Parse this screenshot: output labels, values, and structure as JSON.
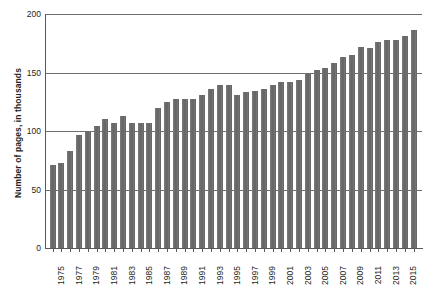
{
  "chart_data": {
    "type": "bar",
    "title": "",
    "xlabel": "",
    "ylabel": "Number of pages, in thousands",
    "ylim": [
      0,
      200
    ],
    "yticks": [
      0,
      50,
      100,
      150,
      200
    ],
    "grid": "horizontal",
    "legend": "none",
    "bar_color": "#6e6e6e",
    "axis_color": "#58595b",
    "categories": [
      "1975",
      "1976",
      "1977",
      "1978",
      "1979",
      "1980",
      "1981",
      "1982",
      "1983",
      "1984",
      "1985",
      "1986",
      "1987",
      "1988",
      "1989",
      "1990",
      "1991",
      "1992",
      "1993",
      "1994",
      "1995",
      "1996",
      "1997",
      "1998",
      "1999",
      "2000",
      "2001",
      "2002",
      "2003",
      "2004",
      "2005",
      "2006",
      "2007",
      "2008",
      "2009",
      "2010",
      "2011",
      "2012",
      "2013",
      "2014",
      "2015",
      "2016"
    ],
    "xtick_labels": [
      "1975",
      "1977",
      "1979",
      "1981",
      "1983",
      "1985",
      "1987",
      "1989",
      "1991",
      "1993",
      "1995",
      "1997",
      "1999",
      "2001",
      "2003",
      "2005",
      "2007",
      "2009",
      "2011",
      "2013",
      "2015"
    ],
    "values": [
      71,
      73,
      83,
      97,
      99,
      104,
      110,
      107,
      113,
      107,
      107,
      107,
      120,
      125,
      127,
      127,
      127,
      131,
      136,
      139,
      139,
      131,
      133,
      134,
      136,
      139,
      142,
      142,
      144,
      150,
      152,
      154,
      158,
      163,
      165,
      172,
      171,
      176,
      178,
      178,
      181,
      186
    ]
  }
}
